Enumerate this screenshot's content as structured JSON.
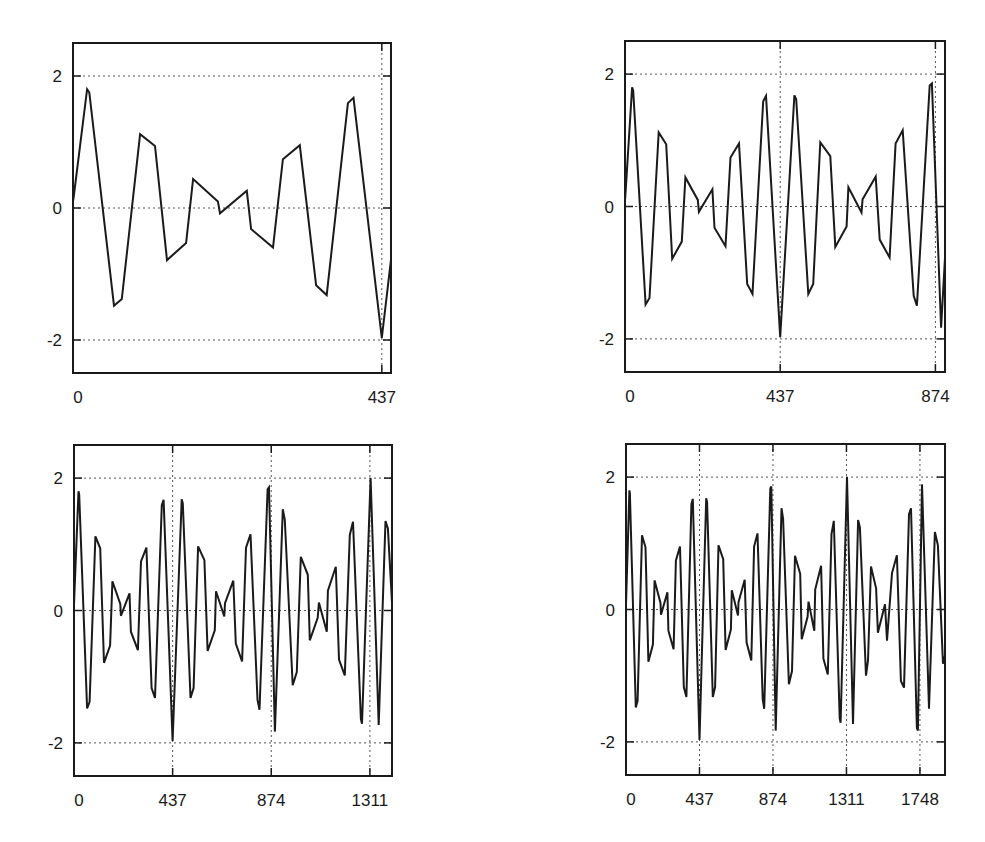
{
  "chart_data": [
    {
      "id": "top-left",
      "type": "line",
      "title": "",
      "xlabel": "",
      "ylabel": "",
      "xlim": [
        0,
        450
      ],
      "ylim": [
        -2.5,
        2.5
      ],
      "x_ticks": [
        0,
        437
      ],
      "x_tick_labels": [
        "0",
        "437"
      ],
      "x_grid_at": [
        437
      ],
      "y_ticks": [
        -2,
        0,
        2
      ],
      "y_tick_labels": [
        "-2",
        "0",
        "2"
      ],
      "grid": true,
      "grid_style": "dotted",
      "legend": null,
      "frame_px": {
        "left": 73,
        "top": 43,
        "right": 391,
        "bottom": 373
      }
    },
    {
      "id": "top-right",
      "type": "line",
      "title": "",
      "xlabel": "",
      "ylabel": "",
      "xlim": [
        0,
        901
      ],
      "ylim": [
        -2.5,
        2.5
      ],
      "x_ticks": [
        0,
        437,
        874
      ],
      "x_tick_labels": [
        "0",
        "437",
        "874"
      ],
      "x_grid_at": [
        437,
        874
      ],
      "y_ticks": [
        -2,
        0,
        2
      ],
      "y_tick_labels": [
        "-2",
        "0",
        "2"
      ],
      "grid": true,
      "grid_style": "dotted",
      "legend": null,
      "frame_px": {
        "left": 625,
        "top": 41,
        "right": 945,
        "bottom": 372
      }
    },
    {
      "id": "bottom-left",
      "type": "line",
      "title": "",
      "xlabel": "",
      "ylabel": "",
      "xlim": [
        0,
        1409
      ],
      "ylim": [
        -2.5,
        2.5
      ],
      "x_ticks": [
        0,
        437,
        874,
        1311
      ],
      "x_tick_labels": [
        "0",
        "437",
        "874",
        "1311"
      ],
      "x_grid_at": [
        437,
        874,
        1311
      ],
      "y_ticks": [
        -2,
        0,
        2
      ],
      "y_tick_labels": [
        "-2",
        "0",
        "2"
      ],
      "grid": true,
      "grid_style": "dotted",
      "legend": null,
      "frame_px": {
        "left": 74,
        "top": 445,
        "right": 392,
        "bottom": 776
      }
    },
    {
      "id": "bottom-right",
      "type": "line",
      "title": "",
      "xlabel": "",
      "ylabel": "",
      "xlim": [
        0,
        1897
      ],
      "ylim": [
        -2.5,
        2.5
      ],
      "x_ticks": [
        0,
        437,
        874,
        1311,
        1748
      ],
      "x_tick_labels": [
        "0",
        "437",
        "874",
        "1311",
        "1748"
      ],
      "x_grid_at": [
        437,
        874,
        1311,
        1748
      ],
      "y_ticks": [
        -2,
        0,
        2
      ],
      "y_tick_labels": [
        "-2",
        "0",
        "2"
      ],
      "grid": true,
      "grid_style": "dotted",
      "legend": null,
      "frame_px": {
        "left": 626,
        "top": 444,
        "right": 945,
        "bottom": 775
      }
    }
  ],
  "series": {
    "name": "signal",
    "color": "#1a1a1a",
    "points": [
      [
        0,
        0.1
      ],
      [
        1,
        0.17
      ],
      [
        20,
        1.8
      ],
      [
        23,
        1.75
      ],
      [
        58,
        -1.48
      ],
      [
        69,
        -1.38
      ],
      [
        95,
        1.12
      ],
      [
        116,
        0.94
      ],
      [
        133,
        -0.79
      ],
      [
        160,
        -0.53
      ],
      [
        170,
        0.44
      ],
      [
        205,
        0.1
      ],
      [
        208,
        -0.08
      ],
      [
        246,
        0.26
      ],
      [
        252,
        -0.32
      ],
      [
        283,
        -0.6
      ],
      [
        297,
        0.74
      ],
      [
        321,
        0.95
      ],
      [
        344,
        -1.17
      ],
      [
        359,
        -1.32
      ],
      [
        389,
        1.59
      ],
      [
        397,
        1.67
      ],
      [
        437,
        -1.97
      ],
      [
        477,
        1.68
      ],
      [
        482,
        1.62
      ],
      [
        516,
        -1.32
      ],
      [
        530,
        -1.17
      ],
      [
        550,
        0.97
      ],
      [
        578,
        0.76
      ],
      [
        592,
        -0.61
      ],
      [
        624,
        -0.3
      ],
      [
        629,
        0.29
      ],
      [
        666,
        -0.09
      ],
      [
        669,
        0.11
      ],
      [
        706,
        0.45
      ],
      [
        717,
        -0.5
      ],
      [
        745,
        -0.77
      ],
      [
        762,
        0.95
      ],
      [
        782,
        1.15
      ],
      [
        813,
        -1.35
      ],
      [
        822,
        -1.5
      ],
      [
        858,
        1.83
      ],
      [
        864,
        1.86
      ],
      [
        890,
        -1.83
      ],
      [
        925,
        1.53
      ],
      [
        934,
        1.37
      ],
      [
        969,
        -1.13
      ],
      [
        987,
        -0.93
      ],
      [
        1005,
        0.81
      ],
      [
        1036,
        0.54
      ],
      [
        1045,
        -0.45
      ],
      [
        1080,
        -0.11
      ],
      [
        1085,
        0.12
      ],
      [
        1120,
        -0.32
      ],
      [
        1125,
        0.3
      ],
      [
        1160,
        0.66
      ],
      [
        1174,
        -0.74
      ],
      [
        1200,
        -0.98
      ],
      [
        1222,
        1.14
      ],
      [
        1236,
        1.34
      ],
      [
        1271,
        -1.64
      ],
      [
        1276,
        -1.71
      ],
      [
        1314,
        2.0
      ],
      [
        1350,
        -1.73
      ],
      [
        1380,
        1.35
      ],
      [
        1391,
        1.24
      ],
      [
        1427,
        -1.0
      ],
      [
        1439,
        -0.77
      ],
      [
        1457,
        0.65
      ],
      [
        1487,
        0.32
      ],
      [
        1498,
        -0.35
      ],
      [
        1540,
        0.08
      ],
      [
        1552,
        -0.47
      ],
      [
        1582,
        0.55
      ],
      [
        1611,
        0.82
      ],
      [
        1635,
        -1.08
      ],
      [
        1653,
        -1.18
      ],
      [
        1683,
        1.44
      ],
      [
        1695,
        1.53
      ],
      [
        1730,
        -1.79
      ],
      [
        1736,
        -1.83
      ],
      [
        1760,
        1.89
      ],
      [
        1802,
        -1.5
      ],
      [
        1837,
        1.17
      ],
      [
        1855,
        0.97
      ],
      [
        1885,
        -0.82
      ],
      [
        1897,
        -0.7
      ]
    ]
  }
}
